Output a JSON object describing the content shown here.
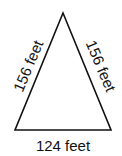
{
  "diagram": {
    "shape": "isosceles-triangle",
    "left_side_label": "156 feet",
    "right_side_label": "156 feet",
    "base_label": "124 feet",
    "stroke_color": "#111111",
    "background": "#ffffff"
  }
}
